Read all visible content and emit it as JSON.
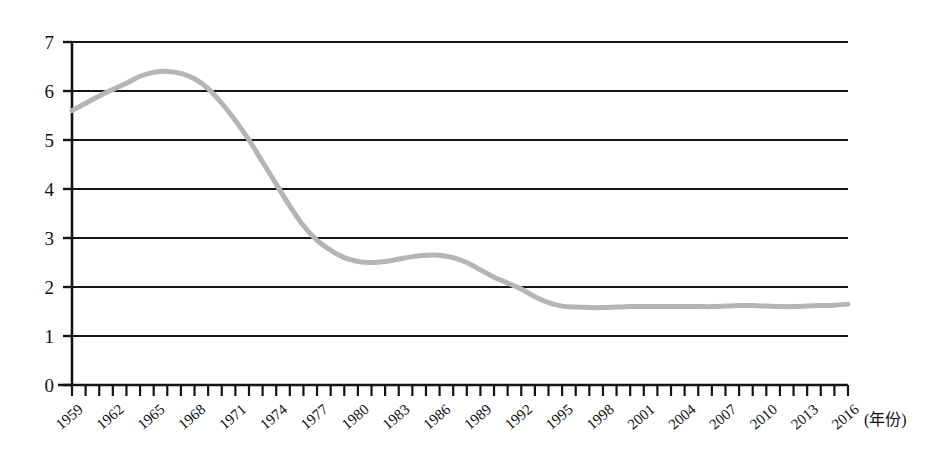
{
  "chart_data": {
    "type": "line",
    "title": "",
    "subtitle": "",
    "xlabel": "(年份)",
    "ylabel": "",
    "xlim": [
      1959,
      2016
    ],
    "ylim": [
      0,
      7
    ],
    "grid": true,
    "legend": null,
    "legend_position": "none",
    "y_ticks": [
      "0",
      "1",
      "2",
      "3",
      "4",
      "5",
      "6",
      "7"
    ],
    "y_tick_values": [
      0,
      1,
      2,
      3,
      4,
      5,
      6,
      7
    ],
    "x_tick_labels": [
      "1959",
      "1962",
      "1965",
      "1968",
      "1971",
      "1974",
      "1977",
      "1980",
      "1983",
      "1986",
      "1989",
      "1992",
      "1995",
      "1998",
      "2001",
      "2004",
      "2007",
      "2010",
      "2013",
      "2016"
    ],
    "x_tick_values": [
      1959,
      1962,
      1965,
      1968,
      1971,
      1974,
      1977,
      1980,
      1983,
      1986,
      1989,
      1992,
      1995,
      1998,
      2001,
      2004,
      2007,
      2010,
      2013,
      2016
    ],
    "x_minor_every": 1,
    "series": [
      {
        "name": "",
        "color": "#b5b5b5",
        "line_width": 5,
        "x": [
          1959,
          1960,
          1961,
          1962,
          1963,
          1964,
          1965,
          1966,
          1967,
          1968,
          1969,
          1970,
          1971,
          1972,
          1973,
          1974,
          1975,
          1976,
          1977,
          1978,
          1979,
          1980,
          1981,
          1982,
          1983,
          1984,
          1985,
          1986,
          1987,
          1988,
          1989,
          1990,
          1991,
          1992,
          1993,
          1994,
          1995,
          1996,
          1997,
          1998,
          1999,
          2000,
          2001,
          2002,
          2003,
          2004,
          2005,
          2006,
          2007,
          2008,
          2009,
          2010,
          2011,
          2012,
          2013,
          2014,
          2015,
          2016
        ],
        "values": [
          5.6,
          5.75,
          5.9,
          6.03,
          6.16,
          6.3,
          6.38,
          6.4,
          6.36,
          6.25,
          6.05,
          5.75,
          5.4,
          5.0,
          4.55,
          4.1,
          3.65,
          3.25,
          2.95,
          2.75,
          2.6,
          2.52,
          2.5,
          2.52,
          2.57,
          2.62,
          2.65,
          2.65,
          2.6,
          2.5,
          2.35,
          2.2,
          2.08,
          1.96,
          1.8,
          1.68,
          1.61,
          1.59,
          1.58,
          1.58,
          1.59,
          1.6,
          1.6,
          1.6,
          1.6,
          1.6,
          1.6,
          1.6,
          1.61,
          1.62,
          1.62,
          1.61,
          1.6,
          1.6,
          1.61,
          1.62,
          1.63,
          1.65
        ]
      }
    ]
  },
  "axis": {
    "x_unit_suffix": "(年份)"
  }
}
